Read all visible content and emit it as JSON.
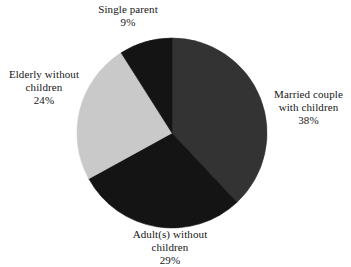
{
  "chart_data": {
    "type": "pie",
    "title": "",
    "subtitle": "",
    "xlabel": "",
    "ylabel": "",
    "legend_position": "none",
    "grid": false,
    "start_angle_deg": 0,
    "direction": "clockwise",
    "center": {
      "x": 172,
      "y": 133
    },
    "radius": 95,
    "categories": [
      "Married couple with children",
      "Adult(s) without children",
      "Elderly without children",
      "Single parent"
    ],
    "values": [
      38,
      29,
      24,
      9
    ],
    "value_unit": "%",
    "slices": [
      {
        "name": "Married couple with children",
        "label_line1": "Married couple",
        "label_line2": "with children",
        "value": 38,
        "value_text": "38%",
        "color": "#333333",
        "start_deg": 0,
        "end_deg": 136.8,
        "label_position": "right"
      },
      {
        "name": "Adult(s) without children",
        "label_line1": "Adult(s) without",
        "label_line2": "children",
        "value": 29,
        "value_text": "29%",
        "color": "#141414",
        "start_deg": 136.8,
        "end_deg": 241.2,
        "label_position": "bottom"
      },
      {
        "name": "Elderly without children",
        "label_line1": "Elderly without",
        "label_line2": "children",
        "value": 24,
        "value_text": "24%",
        "color": "#c9c9c9",
        "start_deg": 241.2,
        "end_deg": 327.6,
        "label_position": "left"
      },
      {
        "name": "Single parent",
        "label_line1": "Single parent",
        "label_line2": "",
        "value": 9,
        "value_text": "9%",
        "color": "#141414",
        "start_deg": 327.6,
        "end_deg": 360,
        "label_position": "top"
      }
    ],
    "colors": {
      "background": "#ffffff",
      "text": "#161616",
      "married_couple": "#333333",
      "adults_without_children": "#141414",
      "elderly_without_children": "#c9c9c9",
      "single_parent": "#141414"
    }
  }
}
